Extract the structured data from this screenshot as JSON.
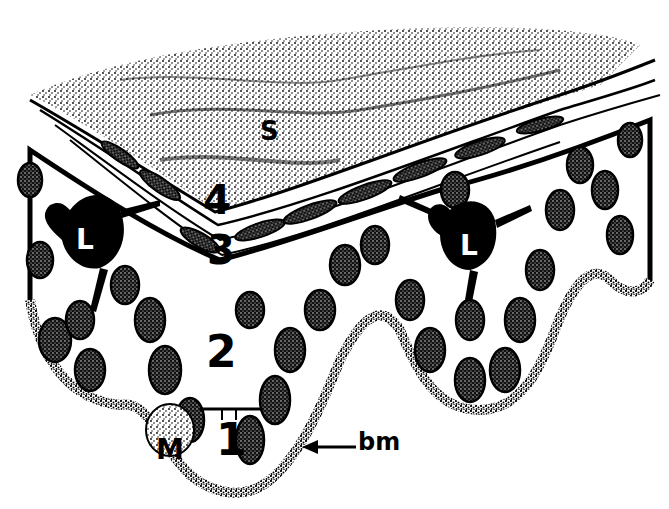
{
  "figure": {
    "labels": [
      {
        "id": "S",
        "text": "S",
        "x": 268,
        "y": 128,
        "size": 26
      },
      {
        "id": "layer4",
        "text": "4",
        "x": 203,
        "y": 180,
        "size": 40
      },
      {
        "id": "layer3",
        "text": "3",
        "x": 207,
        "y": 232,
        "size": 40
      },
      {
        "id": "layer2",
        "text": "2",
        "x": 207,
        "y": 330,
        "size": 44
      },
      {
        "id": "layer1",
        "text": "1",
        "x": 218,
        "y": 422,
        "size": 44
      },
      {
        "id": "M",
        "text": "M",
        "x": 156,
        "y": 436,
        "size": 30
      },
      {
        "id": "L_left",
        "text": "L",
        "x": 80,
        "y": 230,
        "size": 28
      },
      {
        "id": "L_right",
        "text": "L",
        "x": 460,
        "y": 235,
        "size": 28
      },
      {
        "id": "bm",
        "text": "bm",
        "x": 358,
        "y": 427,
        "size": 24
      }
    ],
    "colors": {
      "ink": "#000000",
      "paper": "#ffffff"
    }
  }
}
